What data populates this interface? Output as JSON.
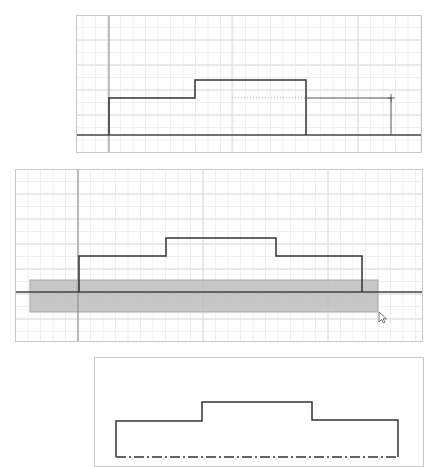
{
  "figure": {
    "colors": {
      "background": "#ffffff",
      "panel_border": "#c8c8c8",
      "grid_minor": "#efefef",
      "grid_major": "#dcdcdc",
      "axis": "#8a8a8a",
      "profile": "#333333",
      "baseline": "#444444",
      "selection_fill": "#bdbdbd",
      "selection_stroke": "#a8a8a8",
      "dotted_guide": "#b0b0b0",
      "cursor": "#666666"
    }
  },
  "panels": [
    {
      "name": "step-1-drawing-last-segment",
      "frame": {
        "x": 76,
        "y": 15,
        "w": 346,
        "h": 138
      },
      "grid": {
        "minor": 12.5,
        "major_x": [
          108,
          232,
          358
        ],
        "major_y": [
          40,
          65,
          90,
          115
        ]
      },
      "vertical_axis_x": 109,
      "baseline": {
        "x1": 76,
        "x2": 422,
        "y": 135
      },
      "profile_points": [
        [
          109,
          135
        ],
        [
          109,
          98
        ],
        [
          195,
          98
        ],
        [
          195,
          80
        ],
        [
          306,
          80
        ],
        [
          306,
          135
        ]
      ],
      "current_segment": [
        [
          306,
          98
        ],
        [
          391,
          98
        ],
        [
          391,
          135
        ]
      ],
      "dotted_guide": {
        "x1": 232,
        "x2": 306,
        "y": 98
      },
      "cursor": {
        "type": "crosshair",
        "x": 391,
        "y": 98
      }
    },
    {
      "name": "step-2-window-select-baseline",
      "frame": {
        "x": 15,
        "y": 169,
        "w": 408,
        "h": 173
      },
      "grid": {
        "minor": 12.5,
        "major_x": [
          78,
          203,
          328
        ],
        "major_y": [
          194,
          219,
          244,
          269,
          294,
          319
        ]
      },
      "vertical_axis_x": 78,
      "baseline": {
        "x1": 15,
        "x2": 423,
        "y": 292
      },
      "profile_points": [
        [
          79,
          292
        ],
        [
          79,
          256
        ],
        [
          166,
          256
        ],
        [
          166,
          238
        ],
        [
          276,
          238
        ],
        [
          276,
          256
        ],
        [
          362,
          256
        ],
        [
          362,
          292
        ]
      ],
      "selection_box": {
        "x": 30,
        "y": 280,
        "w": 348,
        "h": 32
      },
      "cursor": {
        "type": "arrow",
        "x": 379,
        "y": 312
      }
    },
    {
      "name": "step-3-result-centerline",
      "frame": {
        "x": 94,
        "y": 357,
        "w": 330,
        "h": 110
      },
      "profile_points": [
        [
          116,
          457
        ],
        [
          116,
          421
        ],
        [
          202,
          421
        ],
        [
          202,
          402
        ],
        [
          312,
          402
        ],
        [
          312,
          420
        ],
        [
          398,
          420
        ],
        [
          398,
          457
        ]
      ],
      "centerline": {
        "x1": 116,
        "x2": 398,
        "y": 457,
        "style": "dash-dot"
      }
    }
  ]
}
